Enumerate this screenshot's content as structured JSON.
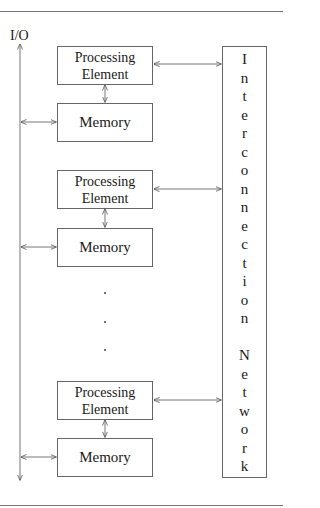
{
  "diagram": {
    "io_label": "I/O",
    "nodes": [
      {
        "processing_element": "Processing\nElement",
        "memory": "Memory"
      },
      {
        "processing_element": "Processing\nElement",
        "memory": "Memory"
      },
      {
        "processing_element": "Processing\nElement",
        "memory": "Memory"
      }
    ],
    "pe_lines": [
      [
        "Processing",
        "Element"
      ],
      [
        "Processing",
        "Element"
      ],
      [
        "Processing",
        "Element"
      ]
    ],
    "memory_labels": [
      "Memory",
      "Memory",
      "Memory"
    ],
    "ellipsis": ".",
    "interconnect": {
      "label": "Interconnection Network",
      "letters": [
        "I",
        "n",
        "t",
        "e",
        "r",
        "c",
        "o",
        "n",
        "n",
        "e",
        "c",
        "t",
        "i",
        "o",
        "n",
        "",
        "N",
        "e",
        "t",
        "w",
        "o",
        "r",
        "k"
      ]
    },
    "edges": [
      {
        "from": "Processing Element 1",
        "to": "Interconnection Network",
        "type": "bidirectional"
      },
      {
        "from": "Processing Element 2",
        "to": "Interconnection Network",
        "type": "bidirectional"
      },
      {
        "from": "Processing Element 3",
        "to": "Interconnection Network",
        "type": "bidirectional"
      },
      {
        "from": "Processing Element 1",
        "to": "Memory 1",
        "type": "bidirectional"
      },
      {
        "from": "Processing Element 2",
        "to": "Memory 2",
        "type": "bidirectional"
      },
      {
        "from": "Processing Element 3",
        "to": "Memory 3",
        "type": "bidirectional"
      },
      {
        "from": "I/O bus",
        "to": "Memory 1",
        "type": "bidirectional"
      },
      {
        "from": "I/O bus",
        "to": "Memory 2",
        "type": "bidirectional"
      },
      {
        "from": "I/O bus",
        "to": "Memory 3",
        "type": "bidirectional"
      }
    ]
  }
}
